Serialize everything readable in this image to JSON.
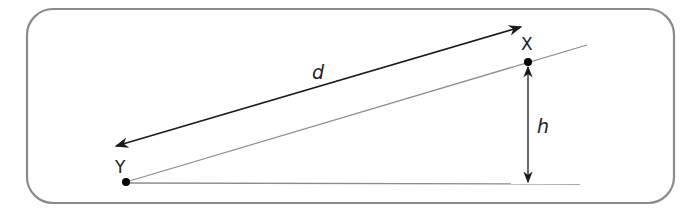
{
  "diagram": {
    "labels": {
      "d": "d",
      "h": "h",
      "x": "X",
      "y": "Y"
    },
    "colors": {
      "frame": "#8a8a8a",
      "incline": "#8c8c8c",
      "baseline": "#8c8c8c",
      "arrow": "#1a1a1a",
      "point": "#000000"
    },
    "points": {
      "Y": [
        126,
        182
      ],
      "X": [
        528,
        62
      ]
    }
  }
}
